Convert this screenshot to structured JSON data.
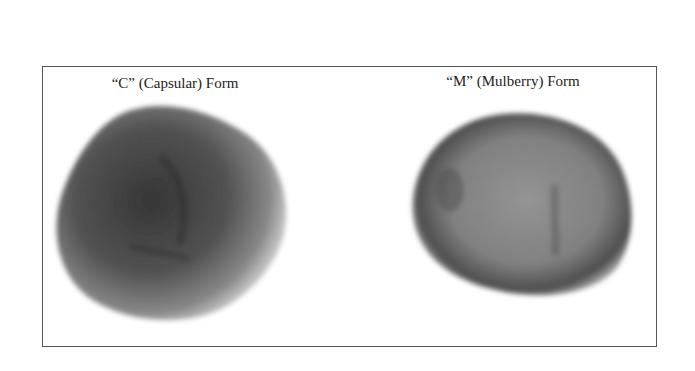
{
  "figure": {
    "panels": [
      {
        "label": "“C” (Capsular) Form",
        "subject": "capsular-form-particle"
      },
      {
        "label": "“M” (Mulberry) Form",
        "subject": "mulberry-form-particle"
      }
    ],
    "colors": {
      "frame": "#555555",
      "particle_dark": "#3a3a3a",
      "particle_light": "#9a9a9a"
    }
  }
}
